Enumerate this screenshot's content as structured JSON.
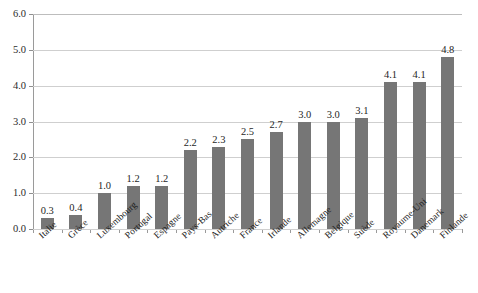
{
  "figure": {
    "clipped_caption": "",
    "background_color": "#ffffff",
    "bar_color": "#767676",
    "grid_color": "#cfcfcf",
    "axis_color": "#9a9a9a",
    "text_color": "#1f1f1f"
  },
  "chart_data": {
    "type": "bar",
    "title": "",
    "xlabel": "",
    "ylabel": "",
    "ylim": [
      0.0,
      6.0
    ],
    "ytick_labels": [
      "0.0",
      "1.0",
      "2.0",
      "3.0",
      "4.0",
      "5.0",
      "6.0"
    ],
    "ytick_values": [
      0.0,
      1.0,
      2.0,
      3.0,
      4.0,
      5.0,
      6.0
    ],
    "grid": true,
    "grid_axis": "y",
    "legend": false,
    "orientation": "vertical",
    "sorted": "ascending",
    "categories": [
      "Italie",
      "Grèce",
      "Luxembourg",
      "Portugal",
      "Espagne",
      "Pays-Bas",
      "Autriche",
      "France",
      "Irlande",
      "Allemagne",
      "Belgique",
      "Suède",
      "Royaume-Uni",
      "Danemark",
      "Finlande"
    ],
    "values": [
      0.3,
      0.4,
      1.0,
      1.2,
      1.2,
      2.2,
      2.3,
      2.5,
      2.7,
      3.0,
      3.0,
      3.1,
      4.1,
      4.1,
      4.8
    ],
    "data_labels": [
      "0.3",
      "0.4",
      "1.0",
      "1.2",
      "1.2",
      "2.2",
      "2.3",
      "2.5",
      "2.7",
      "3.0",
      "3.0",
      "3.1",
      "4.1",
      "4.1",
      "4.8"
    ]
  }
}
